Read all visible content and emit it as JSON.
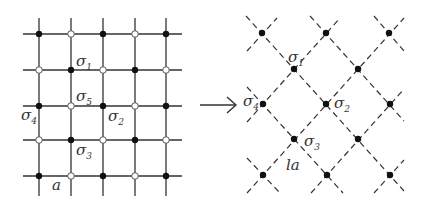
{
  "diagram": {
    "colors": {
      "line": "#333333",
      "dot_fill": "#111111",
      "open_fill": "#ffffff",
      "text": "#333333"
    },
    "left_lattice": {
      "columns_x": [
        39,
        71,
        103,
        135,
        166
      ],
      "rows_y": [
        34,
        70,
        106,
        140,
        176
      ],
      "site_pattern": [
        [
          "filled",
          "open",
          "filled",
          "open",
          "filled"
        ],
        [
          "open",
          "filled",
          "open",
          "filled",
          "open"
        ],
        [
          "filled",
          "open",
          "filled",
          "open",
          "filled"
        ],
        [
          "open",
          "filled",
          "open",
          "filled",
          "open"
        ],
        [
          "filled",
          "open",
          "filled",
          "open",
          "filled"
        ]
      ],
      "labels": [
        {
          "id": "sigma1",
          "text": "σ",
          "sub": "1",
          "x": 76,
          "y": 66
        },
        {
          "id": "sigma5",
          "text": "σ",
          "sub": "5",
          "x": 76,
          "y": 101
        },
        {
          "id": "sigma4",
          "text": "σ",
          "sub": "4",
          "x": 21,
          "y": 120
        },
        {
          "id": "sigma2",
          "text": "σ",
          "sub": "2",
          "x": 108,
          "y": 121
        },
        {
          "id": "sigma3",
          "text": "σ",
          "sub": "3",
          "x": 76,
          "y": 155
        },
        {
          "id": "a",
          "text": "a",
          "sub": "",
          "x": 52,
          "y": 190
        }
      ]
    },
    "arrow": {
      "glyph": "→",
      "x1": 200,
      "x2": 236,
      "y": 105
    },
    "right_lattice": {
      "dots": [
        [
          262,
          33
        ],
        [
          326,
          33
        ],
        [
          389,
          33
        ],
        [
          294,
          69
        ],
        [
          358,
          69
        ],
        [
          263,
          104
        ],
        [
          326,
          104
        ],
        [
          390,
          104
        ],
        [
          294,
          139
        ],
        [
          358,
          139
        ],
        [
          263,
          175
        ],
        [
          327,
          175
        ],
        [
          390,
          175
        ]
      ],
      "labels": [
        {
          "id": "sigma1",
          "text": "σ",
          "sub": "1",
          "x": 288,
          "y": 62
        },
        {
          "id": "sigma4",
          "text": "σ",
          "sub": "4",
          "x": 243,
          "y": 106
        },
        {
          "id": "sigma2",
          "text": "σ",
          "sub": "2",
          "x": 334,
          "y": 108
        },
        {
          "id": "sigma3",
          "text": "σ",
          "sub": "3",
          "x": 304,
          "y": 146
        },
        {
          "id": "la",
          "text": "la",
          "sub": "",
          "x": 286,
          "y": 170
        }
      ]
    }
  }
}
